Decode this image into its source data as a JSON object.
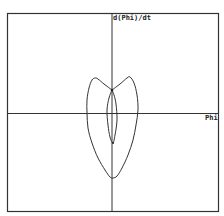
{
  "chart_data": {
    "type": "line",
    "title": "",
    "xlabel": "Phi",
    "ylabel": "d(Phi)/dt",
    "grid": false,
    "legend": null,
    "axes": {
      "x_axis_at": "center",
      "y_axis_at": "center"
    },
    "series": [
      {
        "name": "outer-trajectory",
        "description": "Heart/shield-shaped closed phase-space orbit",
        "points_px": [
          [
            112,
            90
          ],
          [
            104,
            84
          ],
          [
            98,
            79
          ],
          [
            95,
            78
          ],
          [
            92,
            80
          ],
          [
            89,
            88
          ],
          [
            87,
            100
          ],
          [
            87,
            113
          ],
          [
            88,
            128
          ],
          [
            92,
            143
          ],
          [
            98,
            158
          ],
          [
            105,
            170
          ],
          [
            110,
            177
          ],
          [
            113,
            178
          ],
          [
            117,
            176
          ],
          [
            122,
            168
          ],
          [
            128,
            155
          ],
          [
            133,
            140
          ],
          [
            136,
            125
          ],
          [
            138,
            110
          ],
          [
            137,
            95
          ],
          [
            134,
            83
          ],
          [
            130,
            77
          ],
          [
            127,
            78
          ],
          [
            120,
            84
          ],
          [
            112,
            90
          ]
        ]
      },
      {
        "name": "inner-lens",
        "description": "Narrow lens-shaped inner orbit",
        "points_px": [
          [
            112,
            90
          ],
          [
            109,
            98
          ],
          [
            107,
            110
          ],
          [
            108,
            125
          ],
          [
            110,
            137
          ],
          [
            113,
            143
          ],
          [
            115,
            135
          ],
          [
            117,
            120
          ],
          [
            116,
            104
          ],
          [
            114,
            95
          ],
          [
            112,
            90
          ]
        ]
      }
    ],
    "colors": {
      "curve": "#333333",
      "axes": "#333333",
      "frame": "#333333",
      "background": "#ffffff"
    }
  },
  "labels": {
    "y_axis": "d(Phi)/dt",
    "x_axis": "Phi"
  }
}
